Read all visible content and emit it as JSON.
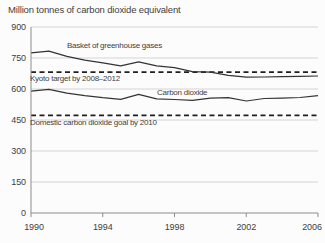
{
  "page": {
    "title": "Million tonnes of carbon dioxide equivalent"
  },
  "colors": {
    "background": "#fcfcfc",
    "text": "#3f3f3f",
    "gridline": "#cacaca",
    "axis": "#8c8c8c",
    "series_line": "#343434",
    "reference_line": "#1f1f1f"
  },
  "chart_data": {
    "type": "line",
    "title": "Million tonnes of carbon dioxide equivalent",
    "xlabel": "",
    "ylabel": "Million tonnes of carbon dioxide equivalent",
    "xlim": [
      1990,
      2006
    ],
    "ylim": [
      0,
      900
    ],
    "xticks": [
      1990,
      1994,
      1998,
      2002,
      2006
    ],
    "yticks": [
      0,
      150,
      300,
      450,
      600,
      750,
      900
    ],
    "grid": true,
    "legend_position": "inline-annotations",
    "x": [
      1990,
      1991,
      1992,
      1993,
      1994,
      1995,
      1996,
      1997,
      1998,
      1999,
      2000,
      2001,
      2002,
      2003,
      2004,
      2005,
      2006
    ],
    "series": [
      {
        "name": "Basket of greenhouse gases",
        "style": "solid",
        "values": [
          775,
          783,
          758,
          740,
          727,
          712,
          731,
          712,
          703,
          684,
          682,
          666,
          657,
          658,
          660,
          661,
          663
        ],
        "label_pos": {
          "x": 67,
          "y": 48
        }
      },
      {
        "name": "Carbon dioxide",
        "style": "solid",
        "values": [
          590,
          598,
          580,
          568,
          558,
          550,
          574,
          552,
          549,
          545,
          556,
          558,
          542,
          554,
          556,
          559,
          568
        ],
        "label_pos": {
          "x": 157,
          "y": 95
        }
      }
    ],
    "reference_lines": [
      {
        "name": "Kyoto target by 2008–2012",
        "style": "dashed",
        "value": 682,
        "label_pos": {
          "x": 30,
          "y": 81
        }
      },
      {
        "name": "Domestic carbon dioxide goal by 2010",
        "style": "dashed",
        "value": 472,
        "label_pos": {
          "x": 30,
          "y": 125
        }
      }
    ]
  }
}
